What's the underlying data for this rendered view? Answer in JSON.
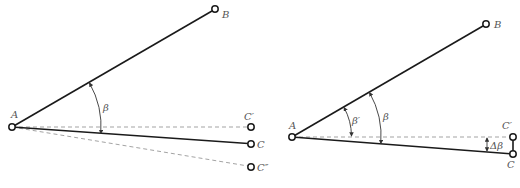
{
  "left_diagram": {
    "labels": {
      "A": "A",
      "B": "B",
      "C_prime": "C′",
      "C": "C",
      "C_double_prime": "C″",
      "beta": "β"
    }
  },
  "right_diagram": {
    "labels": {
      "A": "A",
      "B": "B",
      "C_prime": "C′",
      "C": "C",
      "beta": "β",
      "beta_prime": "β′",
      "delta_beta": "Δβ"
    }
  },
  "colors": {
    "line": "#1a1a1a",
    "dashed": "#999999",
    "label": "#555555"
  }
}
